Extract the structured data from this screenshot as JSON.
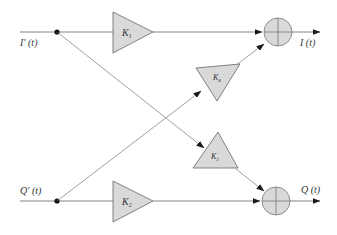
{
  "diagram": {
    "inputs": [
      {
        "id": "i_prime",
        "label": "I′ (t)"
      },
      {
        "id": "q_prime",
        "label": "Q′ (t)"
      }
    ],
    "outputs": [
      {
        "id": "i_out",
        "label": "I (t)"
      },
      {
        "id": "q_out",
        "label": "Q (t)"
      }
    ],
    "gains": [
      {
        "id": "k1",
        "label": "K",
        "sub": "1",
        "path": "I'(t) to I(t) summer"
      },
      {
        "id": "k2",
        "label": "K",
        "sub": "2",
        "path": "Q'(t) to Q(t) summer"
      },
      {
        "id": "k3",
        "label": "K",
        "sub": "3",
        "path": "I'(t) to Q(t) summer"
      },
      {
        "id": "k4",
        "label": "K",
        "sub": "4",
        "path": "Q'(t) to I(t) summer"
      }
    ],
    "summers": [
      {
        "id": "sum_i",
        "symbol": "+"
      },
      {
        "id": "sum_q",
        "symbol": "+"
      }
    ],
    "colors": {
      "line": "#555555",
      "block_fill": "#d9d9d9",
      "block_stroke": "#666666",
      "arrow": "#1a1a1a"
    }
  }
}
